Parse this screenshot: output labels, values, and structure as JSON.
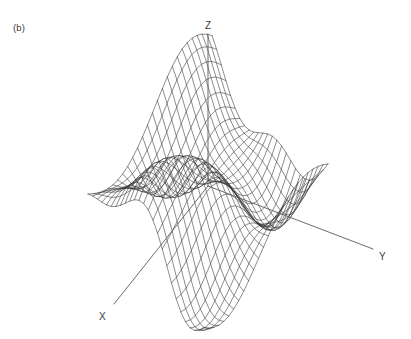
{
  "figure": {
    "panel_label": "(b)",
    "background_color": "#ffffff",
    "mesh_color": "#2e2e2e",
    "axis_color": "#5a5a5a",
    "text_color": "#3c3c3c"
  },
  "axes": {
    "z": {
      "label": "Z",
      "label_x": 205,
      "label_y": 29,
      "line": {
        "x1": 208,
        "y1": 34,
        "x2": 208,
        "y2": 186
      }
    },
    "y": {
      "label": "Y",
      "label_x": 379,
      "label_y": 260,
      "line": {
        "x1": 208,
        "y1": 186,
        "x2": 373,
        "y2": 249
      }
    },
    "x": {
      "label": "X",
      "label_x": 99,
      "label_y": 320,
      "line": {
        "x1": 208,
        "y1": 186,
        "x2": 114,
        "y2": 304
      }
    }
  },
  "chart_data": {
    "type": "surface",
    "title": "",
    "subtitle": "",
    "panel": "(b)",
    "xlabel": "X",
    "ylabel": "Y",
    "zlabel": "Z",
    "function": "z = 0.62*sin(2.55*u)*cos(2.35*v) + 0.30*sin(4.2*u + 1.1)*sin(3.0*v) + 0.22*cos(5.1*v - 0.4)",
    "grid": {
      "nu": 26,
      "nv": 26,
      "u_range": [
        -1.0,
        1.0
      ],
      "v_range": [
        -1.0,
        1.0
      ]
    },
    "projection": {
      "origin_x": 208,
      "origin_y": 186,
      "u_axis_screen": [
        -1.62,
        2.05
      ],
      "v_axis_screen": [
        2.86,
        1.09
      ],
      "z_axis_screen": [
        0,
        -76
      ],
      "z_scale": 1.0
    },
    "zlim": [
      -1.1,
      1.15
    ],
    "legend": null,
    "features": [
      {
        "name": "back-peak",
        "screen_x": 163,
        "screen_y": 48,
        "kind": "maximum"
      },
      {
        "name": "right-back-peak",
        "screen_x": 262,
        "screen_y": 95,
        "kind": "maximum"
      },
      {
        "name": "right-edge-peak",
        "screen_x": 362,
        "screen_y": 126,
        "kind": "maximum"
      },
      {
        "name": "left-valley",
        "screen_x": 78,
        "screen_y": 255,
        "kind": "minimum"
      },
      {
        "name": "center-saddle",
        "screen_x": 208,
        "screen_y": 186,
        "kind": "saddle"
      },
      {
        "name": "front-valley",
        "screen_x": 255,
        "screen_y": 300,
        "kind": "minimum"
      }
    ]
  }
}
